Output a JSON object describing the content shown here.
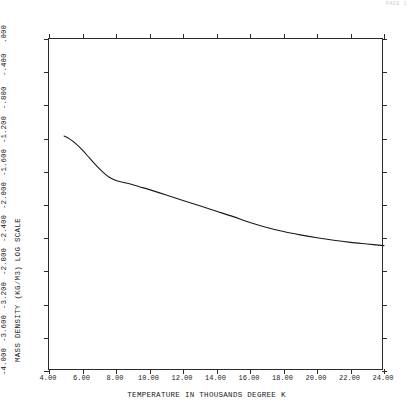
{
  "header": {
    "note": "PAGE 1"
  },
  "chart_data": {
    "type": "line",
    "title": "",
    "xlabel": "TEMPERATURE IN THOUSANDS DEGREE K",
    "ylabel": "MASS DENSITY (KG/M3)   LOG SCALE",
    "ylabel_parts": [
      "MASS DENSITY (KG/M3)",
      "LOG SCALE"
    ],
    "xlim": [
      4.0,
      24.0
    ],
    "ylim": [
      -4.0,
      0.0
    ],
    "grid": false,
    "legend": "none",
    "xticks": [
      4.0,
      6.0,
      8.0,
      10.0,
      12.0,
      14.0,
      16.0,
      18.0,
      20.0,
      22.0,
      24.0
    ],
    "xtick_labels": [
      "4.00",
      "6.00",
      "8.00",
      "10.00",
      "12.00",
      "14.00",
      "16.00",
      "18.00",
      "20.00",
      "22.00",
      "24.00"
    ],
    "yticks": [
      0.0,
      -0.4,
      -0.8,
      -1.2,
      -1.6,
      -2.0,
      -2.4,
      -2.8,
      -3.2,
      -3.6,
      -4.0
    ],
    "ytick_labels": [
      ".000",
      "-.400",
      "-.800",
      "-1.200",
      "-1.600",
      "-2.000",
      "-2.400",
      "-2.800",
      "-3.200",
      "-3.600",
      "-4.000"
    ],
    "series": [
      {
        "name": "mass density",
        "color": "#1a1a1a",
        "x": [
          4.9,
          5.2,
          5.6,
          6.0,
          6.4,
          6.8,
          7.2,
          7.6,
          8.0,
          8.4,
          8.8,
          9.4,
          10.0,
          11.0,
          12.0,
          13.0,
          14.0,
          15.0,
          16.0,
          17.0,
          18.0,
          19.0,
          20.0,
          21.0,
          22.0,
          23.0,
          24.0
        ],
        "y": [
          -1.17,
          -1.2,
          -1.26,
          -1.34,
          -1.43,
          -1.52,
          -1.6,
          -1.665,
          -1.705,
          -1.725,
          -1.745,
          -1.78,
          -1.815,
          -1.88,
          -1.945,
          -2.01,
          -2.075,
          -2.14,
          -2.21,
          -2.27,
          -2.32,
          -2.36,
          -2.395,
          -2.425,
          -2.45,
          -2.47,
          -2.49
        ]
      }
    ]
  }
}
